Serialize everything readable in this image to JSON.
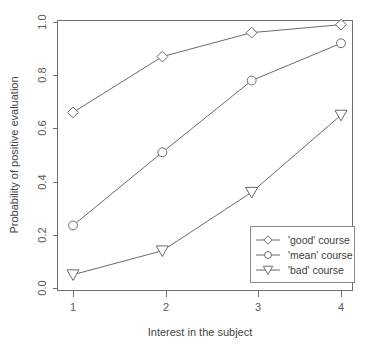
{
  "chart_data": {
    "type": "line",
    "title": "",
    "xlabel": "Interest in the subject",
    "ylabel": "Probability of positive evaluation",
    "x": [
      1,
      2,
      3,
      4
    ],
    "categories": [
      "1",
      "2",
      "3",
      "4"
    ],
    "xtick_labels": [
      "1",
      "2",
      "3",
      "4"
    ],
    "ytick_labels": [
      "0.0",
      "0.2",
      "0.4",
      "0.6",
      "0.8",
      "1.0"
    ],
    "ytick_values": [
      0.0,
      0.2,
      0.4,
      0.6,
      0.8,
      1.0
    ],
    "xlim": [
      0.7,
      4.3
    ],
    "ylim": [
      0.0,
      1.0
    ],
    "grid": false,
    "legend_position": "bottom-right",
    "series": [
      {
        "name": "'good' course",
        "marker": "diamond",
        "values": [
          0.66,
          0.87,
          0.96,
          0.99
        ]
      },
      {
        "name": "'mean' course",
        "marker": "circle",
        "values": [
          0.235,
          0.51,
          0.78,
          0.92
        ]
      },
      {
        "name": "'bad' course",
        "marker": "triangle-down",
        "values": [
          0.05,
          0.14,
          0.36,
          0.65
        ]
      }
    ],
    "colors": {
      "line": "#6a6a6a",
      "axis": "#6f6f6f",
      "text": "#444444",
      "background": "#ffffff"
    }
  },
  "legend": {
    "items": [
      {
        "label": "'good' course",
        "marker": "diamond"
      },
      {
        "label": "'mean' course",
        "marker": "circle"
      },
      {
        "label": "'bad' course",
        "marker": "triangle-down"
      }
    ]
  },
  "axes": {
    "x_title": "Interest in the subject",
    "y_title": "Probability of positive evaluation",
    "x_ticks": [
      "1",
      "2",
      "3",
      "4"
    ],
    "y_ticks": [
      "0.0",
      "0.2",
      "0.4",
      "0.6",
      "0.8",
      "1.0"
    ]
  }
}
